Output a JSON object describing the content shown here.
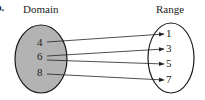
{
  "part_label": "b.",
  "domain": {
    "title": "Domain",
    "values": [
      "4",
      "6",
      "8"
    ],
    "fill": "#b3b3b3"
  },
  "range": {
    "title": "Range",
    "values": [
      "1",
      "3",
      "5",
      "7"
    ],
    "fill": "#ffffff"
  },
  "mappings": [
    {
      "from": "4",
      "to": "1"
    },
    {
      "from": "6",
      "to": "3"
    },
    {
      "from": "6",
      "to": "5"
    },
    {
      "from": "8",
      "to": "7"
    }
  ]
}
